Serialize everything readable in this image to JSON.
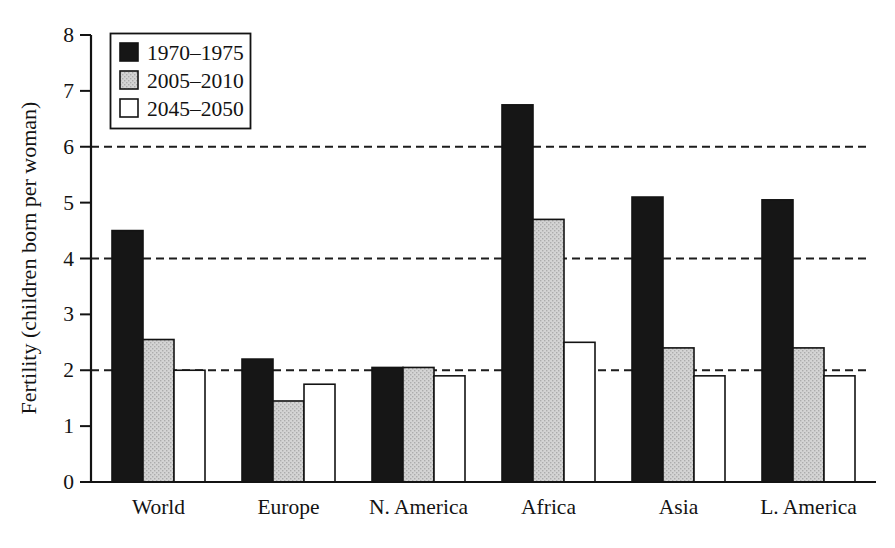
{
  "chart_data": {
    "type": "bar",
    "title": "",
    "xlabel": "",
    "ylabel": "Fertility (children born per woman)",
    "ylim": [
      0,
      8
    ],
    "yticks": [
      0,
      1,
      2,
      3,
      4,
      5,
      6,
      7,
      8
    ],
    "gridlines_y": [
      2,
      4,
      6
    ],
    "grid_style": "dashed",
    "legend_position": "top-left",
    "categories": [
      "World",
      "Europe",
      "N. America",
      "Africa",
      "Asia",
      "L. America"
    ],
    "series": [
      {
        "name": "1970–1975",
        "swatch": "black",
        "color": "#161616",
        "values": [
          4.5,
          2.2,
          2.05,
          6.75,
          5.1,
          5.05
        ]
      },
      {
        "name": "2005–2010",
        "swatch": "stipple-gray",
        "color": "#cccccc",
        "values": [
          2.55,
          1.45,
          2.05,
          4.7,
          2.4,
          2.4
        ]
      },
      {
        "name": "2045–2050",
        "swatch": "white",
        "color": "#ffffff",
        "values": [
          2.0,
          1.75,
          1.9,
          2.5,
          1.9,
          1.9
        ]
      }
    ],
    "colors": {
      "axis": "#131313",
      "grid": "#1d1d1d",
      "bar_outline": "#131313",
      "background": "#ffffff"
    }
  }
}
